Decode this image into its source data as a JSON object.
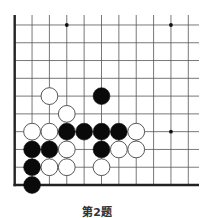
{
  "caption": "第2题",
  "board": {
    "columns": 11,
    "rows": 10,
    "origin_x": 14.7,
    "bottom_y": 185,
    "col_spacing": 17.36,
    "row_spacing": 17.78,
    "top_extent": 15,
    "right_extent": 199,
    "edges": [
      "left",
      "bottom"
    ],
    "line_color": "#555555",
    "edge_color": "#222222",
    "star_points": [
      [
        4,
        10
      ],
      [
        10,
        10
      ],
      [
        10,
        4
      ],
      [
        4,
        4
      ]
    ]
  },
  "stones": [
    {
      "color": "white",
      "col": 3,
      "row": 6
    },
    {
      "color": "black",
      "col": 6,
      "row": 6
    },
    {
      "color": "white",
      "col": 4,
      "row": 5
    },
    {
      "color": "white",
      "col": 2,
      "row": 4
    },
    {
      "color": "white",
      "col": 3,
      "row": 4
    },
    {
      "color": "black",
      "col": 4,
      "row": 4
    },
    {
      "color": "black",
      "col": 5,
      "row": 4
    },
    {
      "color": "black",
      "col": 6,
      "row": 4
    },
    {
      "color": "black",
      "col": 7,
      "row": 4
    },
    {
      "color": "white",
      "col": 8,
      "row": 4
    },
    {
      "color": "black",
      "col": 2,
      "row": 3
    },
    {
      "color": "black",
      "col": 3,
      "row": 3
    },
    {
      "color": "white",
      "col": 4,
      "row": 3
    },
    {
      "color": "black",
      "col": 6,
      "row": 3
    },
    {
      "color": "white",
      "col": 7,
      "row": 3
    },
    {
      "color": "white",
      "col": 8,
      "row": 3
    },
    {
      "color": "black",
      "col": 2,
      "row": 2
    },
    {
      "color": "white",
      "col": 3,
      "row": 2
    },
    {
      "color": "white",
      "col": 4,
      "row": 2
    },
    {
      "color": "white",
      "col": 6,
      "row": 2
    },
    {
      "color": "black",
      "col": 2,
      "row": 1
    }
  ]
}
